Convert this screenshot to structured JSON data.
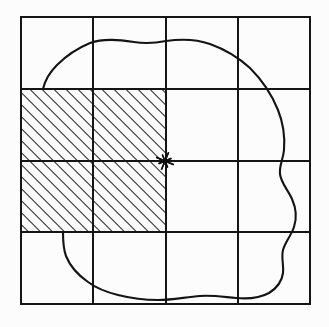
{
  "figure": {
    "title": "Grid with shaded quadrant and irregular region boundary",
    "background_color": "#fdfcfc",
    "ink_color": "#151515"
  },
  "canvas": {
    "width": 329,
    "height": 327
  },
  "grid": {
    "name": "four-by-four-grid",
    "columns": 4,
    "rows": 4,
    "x_positions": [
      21,
      93,
      166,
      238,
      310
    ],
    "y_positions": [
      17,
      89,
      161,
      232,
      304
    ],
    "line_color": "#151515",
    "line_width": 1.6,
    "frame_line_width": 2.0
  },
  "hatched_region": {
    "name": "shaded-quadrant",
    "label": "hatched 2x2 cell block",
    "x": 21,
    "y": 89,
    "width": 145,
    "height": 143,
    "columns_spanned": 2,
    "rows_spanned": 2,
    "hatch_angle_degrees": 45,
    "hatch_direction": "lower-left to upper-right",
    "hatch_spacing_px": 6,
    "hatch_line_width": 2.0,
    "hatch_color": "#1a1a1a",
    "fill_color": "#fdfcfc"
  },
  "center_marker": {
    "name": "center-star-marker",
    "symbol": "asterisk",
    "x": 165,
    "y": 161,
    "radius": 9,
    "ray_count": 8,
    "color": "#101010"
  },
  "blob": {
    "name": "irregular-region-outline",
    "stroke_color": "#141414",
    "stroke_width": 2.1,
    "closed": true,
    "path": "M 43,89 C 45,80 50,72 57,65 C 66,56 78,48 90,43 C 104,38 120,40 134,42 C 146,44 156,43 166,41 C 180,39 196,39 210,44 C 224,49 238,57 250,68 C 262,80 272,95 278,110 C 284,125 285,138 284,150 C 283,160 279,166 280,174 C 281,183 288,190 292,199 C 296,208 297,218 294,227 C 291,236 285,242 283,250 C 281,258 284,265 283,273 C 282,281 277,288 269,293 C 260,298 248,299 236,298 C 224,297 212,295 200,296 C 186,297 172,300 158,300 C 144,300 130,298 118,295 C 106,292 96,288 88,282 C 78,275 70,266 66,256 C 63,248 63,240 63,232 L 63,232"
  }
}
